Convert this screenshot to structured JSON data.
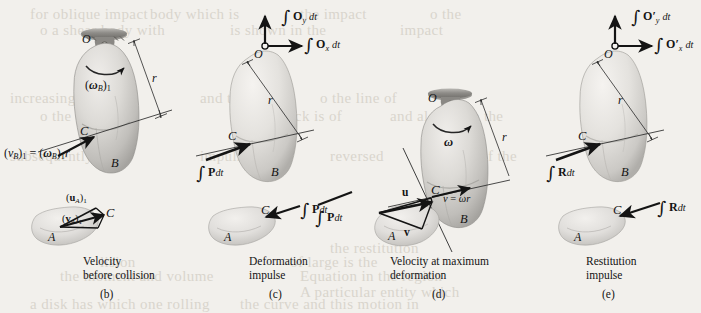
{
  "figure": {
    "background_color": "#f2f0ec",
    "ink_color": "#141414",
    "body_fill_light": "#e8e6e2",
    "body_fill_mid": "#c9c7c3",
    "body_fill_dark": "#a8a6a2"
  },
  "ghost_text": [
    {
      "text": "for oblique impact",
      "x": 30,
      "y": 6
    },
    {
      "text": "body  which  is",
      "x": 150,
      "y": 6
    },
    {
      "text": "the  impact",
      "x": 300,
      "y": 6
    },
    {
      "text": "o  the",
      "x": 430,
      "y": 6
    },
    {
      "text": "o  a  shear  body  with",
      "x": 40,
      "y": 22
    },
    {
      "text": "is  shown  in  the",
      "x": 230,
      "y": 22
    },
    {
      "text": "impact",
      "x": 400,
      "y": 22
    },
    {
      "text": "Since",
      "x": 250,
      "y": 68
    },
    {
      "text": "increasing",
      "x": 10,
      "y": 90
    },
    {
      "text": "and  then",
      "x": 200,
      "y": 90
    },
    {
      "text": "o  the  line  of",
      "x": 320,
      "y": 90
    },
    {
      "text": "o  the  contact",
      "x": 40,
      "y": 108
    },
    {
      "text": "where  shock  is  of",
      "x": 230,
      "y": 108
    },
    {
      "text": "and  also  since  the",
      "x": 390,
      "y": 108
    },
    {
      "text": "subsequently",
      "x": 10,
      "y": 148
    },
    {
      "text": "impulse",
      "x": 200,
      "y": 148
    },
    {
      "text": "reversed",
      "x": 330,
      "y": 148
    },
    {
      "text": "of  the",
      "x": 480,
      "y": 148
    },
    {
      "text": "of  large  is  the",
      "x": 290,
      "y": 254
    },
    {
      "text": "lision",
      "x": 100,
      "y": 254
    },
    {
      "text": "the  restitution",
      "x": 330,
      "y": 240
    },
    {
      "text": "Equation  in  the  region",
      "x": 300,
      "y": 268
    },
    {
      "text": "the  moment  and  volume",
      "x": 60,
      "y": 268
    },
    {
      "text": "A  particular  entity  which",
      "x": 300,
      "y": 284
    },
    {
      "text": "a  disk  has  which  one  rolling",
      "x": 30,
      "y": 296
    },
    {
      "text": "the  curve  and  this  motion  in",
      "x": 240,
      "y": 296
    }
  ],
  "panels": [
    {
      "id": "(b)",
      "caption": [
        "Velocity",
        "before collision"
      ],
      "labels": {
        "pivot": "O",
        "omega": {
          "main": "ω",
          "sub": "B",
          "post": "1"
        },
        "radius": "r",
        "contact": "C",
        "body": "B",
        "velocity_eq_v": "v",
        "velocity_eq_vsub": "B",
        "velocity_eq_vpost": "1",
        "velocity_eq_omega": "ω",
        "velocity_eq_omegasub": "B",
        "velocity_eq_omegapost": "1",
        "velocity_eq_r": "r",
        "small_body": "A",
        "small_contact": "C",
        "u_label": {
          "main": "u",
          "sub": "A",
          "post": "1"
        },
        "v_label": {
          "main": "v",
          "sub": "A",
          "post": "1"
        }
      }
    },
    {
      "id": "(c)",
      "caption": [
        "Deformation",
        "impulse"
      ],
      "labels": {
        "pivot": "O",
        "impulse_y": {
          "vec": "O",
          "sub": "y",
          "dt": "dt"
        },
        "impulse_x": {
          "vec": "O",
          "sub": "x",
          "dt": "dt"
        },
        "radius": "r",
        "contact": "C",
        "body": "B",
        "P_impulse": {
          "vec": "P",
          "dt": "dt"
        },
        "small_body": "A",
        "small_contact": "C"
      }
    },
    {
      "id": "(d)",
      "caption": [
        "Velocity at maximum",
        "deformation"
      ],
      "labels": {
        "pivot": "O",
        "omega": "ω",
        "radius": "r",
        "contact": "C",
        "body": "B",
        "u_vec": "u",
        "v_vec": "v",
        "v_eq": {
          "v": "v",
          "eq": "=",
          "omega": "ω",
          "r": "r"
        },
        "small_body": "A",
        "P_impulse": {
          "vec": "P",
          "dt": "dt"
        }
      }
    },
    {
      "id": "(e)",
      "caption": [
        "Restitution",
        "impulse"
      ],
      "labels": {
        "pivot": "O",
        "impulse_y": {
          "vec": "O′",
          "sub": "y",
          "dt": "dt"
        },
        "impulse_x": {
          "vec": "O′",
          "sub": "x",
          "dt": "dt"
        },
        "radius": "r",
        "contact": "C",
        "body": "B",
        "R_impulse": {
          "vec": "R",
          "dt": "dt"
        },
        "small_body": "A",
        "small_contact": "C"
      }
    }
  ]
}
